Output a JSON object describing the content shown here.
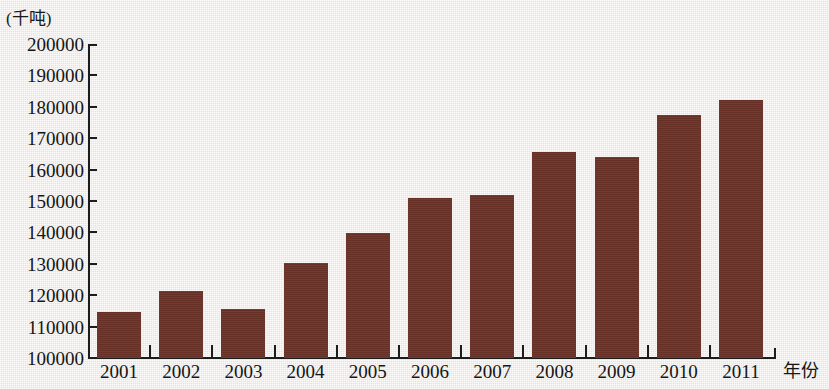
{
  "chart_data": {
    "type": "bar",
    "title": "",
    "subtitle": "",
    "unit_label": "(千吨)",
    "xlabel": "年份",
    "ylabel": "",
    "categories": [
      "2001",
      "2002",
      "2003",
      "2004",
      "2005",
      "2006",
      "2007",
      "2008",
      "2009",
      "2010",
      "2011"
    ],
    "values": [
      114500,
      121300,
      115700,
      130300,
      139700,
      151000,
      152000,
      165700,
      164000,
      177400,
      182300
    ],
    "ylim": [
      100000,
      200000
    ],
    "ytick_labels": [
      "200000",
      "190000",
      "180000",
      "170000",
      "160000",
      "150000",
      "140000",
      "130000",
      "120000",
      "110000",
      "100000"
    ],
    "ytick_values": [
      200000,
      190000,
      180000,
      170000,
      160000,
      150000,
      140000,
      130000,
      120000,
      110000,
      100000
    ],
    "grid": false,
    "legend": null,
    "bar_color": "#6b3228",
    "axis_color": "#1c1c1c",
    "background_color": "#edeae5"
  }
}
